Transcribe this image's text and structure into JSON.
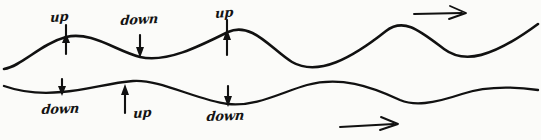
{
  "diagram": {
    "type": "hand-drawn-sketch",
    "medium": "ink on paper",
    "background_color": "#fbfbf9",
    "ink_color": "#111111",
    "width": 541,
    "height": 140
  },
  "waves": {
    "upper": {
      "name": "upper-wave",
      "path": "M 4 69 C 22 66, 40 44, 66 37 C 92 31, 116 51, 140 57 C 166 63, 198 47, 228 32 C 252 21, 272 50, 292 62 C 318 77, 352 58, 386 31 C 404 17, 420 31, 444 49 C 464 64, 492 58, 538 24",
      "crests": [
        {
          "label": "up",
          "x": 66,
          "y": 37
        },
        {
          "label": "up",
          "x": 228,
          "y": 32
        },
        {
          "label": "",
          "x": 388,
          "y": 30
        }
      ],
      "troughs": [
        {
          "label": "down",
          "x": 140,
          "y": 57
        },
        {
          "label": "",
          "x": 292,
          "y": 62
        },
        {
          "label": "",
          "x": 452,
          "y": 57
        }
      ]
    },
    "lower": {
      "name": "lower-wave",
      "path": "M 4 86 C 24 93, 42 94, 62 92 C 88 90, 108 83, 133 81 C 160 79, 196 100, 228 104 C 256 107, 282 92, 307 85 C 340 76, 370 86, 400 100 C 414 106, 432 104, 462 94 C 486 86, 510 86, 538 90",
      "crests": [
        {
          "label": "up",
          "x": 133,
          "y": 81
        },
        {
          "label": "",
          "x": 307,
          "y": 85
        },
        {
          "label": "",
          "x": 492,
          "y": 87
        }
      ],
      "troughs": [
        {
          "label": "down",
          "x": 62,
          "y": 92
        },
        {
          "label": "down",
          "x": 228,
          "y": 104
        },
        {
          "label": "",
          "x": 412,
          "y": 102
        }
      ]
    }
  },
  "labels": {
    "upper_crest_1": "up",
    "upper_trough_1": "down",
    "upper_crest_2": "up",
    "lower_trough_1": "down",
    "lower_crest_1": "up",
    "lower_trough_2": "down"
  },
  "motion_arrows": [
    {
      "name": "up-arrow-upper-crest-1",
      "direction": "up",
      "x": 66,
      "tip_y": 36,
      "tail_y": 54
    },
    {
      "name": "down-arrow-upper-trough-1",
      "direction": "down",
      "x": 140,
      "tip_y": 57,
      "tail_y": 35
    },
    {
      "name": "up-arrow-upper-crest-2",
      "direction": "up",
      "x": 227,
      "tip_y": 31,
      "tail_y": 53
    },
    {
      "name": "down-arrow-lower-trough-1",
      "direction": "down",
      "x": 62,
      "tip_y": 95,
      "tail_y": 79
    },
    {
      "name": "up-arrow-lower-crest-1",
      "direction": "up",
      "x": 125,
      "tip_y": 86,
      "tail_y": 112
    },
    {
      "name": "down-arrow-lower-trough-2",
      "direction": "down",
      "x": 228,
      "tip_y": 106,
      "tail_y": 86
    }
  ],
  "propagation_arrows": [
    {
      "name": "propagation-arrow-upper",
      "direction": "right",
      "x1": 414,
      "y1": 13,
      "x2": 466,
      "y2": 13
    },
    {
      "name": "propagation-arrow-lower",
      "direction": "right",
      "x1": 340,
      "y1": 126,
      "x2": 398,
      "y2": 124
    }
  ]
}
